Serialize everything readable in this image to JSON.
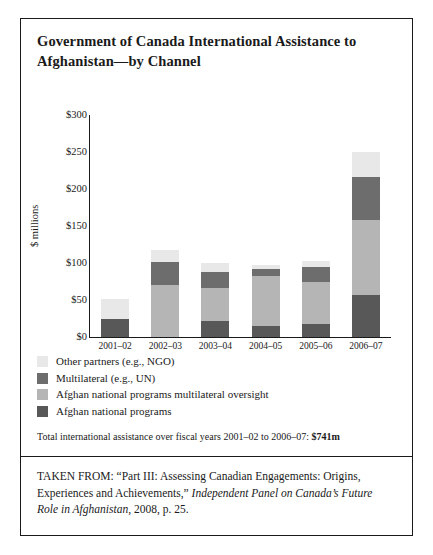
{
  "figure": {
    "title": "Government of Canada International Assistance to Afghanistan—by Channel",
    "total_note_prefix": "Total international assistance over fiscal years 2001–02 to 2006–07: ",
    "total_note_value": "$741m",
    "citation_part1": "TAKEN FROM: “Part III: Assessing Canadian Engagements: Origins, Experiences and Achievements,” ",
    "citation_italic": "Independent Panel on Canada’s Future Role in Afghanistan",
    "citation_part2": ", 2008, p. 25."
  },
  "colors": {
    "other_partners": "#e8e8e8",
    "multilateral": "#6d6d6d",
    "afghan_multilateral_oversight": "#b5b5b5",
    "afghan_national_programs": "#585858",
    "axis": "#1a1a1a",
    "background": "#ffffff"
  },
  "legend": [
    {
      "label": "Other partners (e.g., NGO)",
      "color": "#e8e8e8",
      "key": "other_partners"
    },
    {
      "label": "Multilateral (e.g., UN)",
      "color": "#6d6d6d",
      "key": "multilateral"
    },
    {
      "label": "Afghan national programs multilateral oversight",
      "color": "#b5b5b5",
      "key": "afghan_multilateral_oversight"
    },
    {
      "label": "Afghan national programs",
      "color": "#585858",
      "key": "afghan_national_programs"
    }
  ],
  "chart_data": {
    "type": "bar",
    "subtype": "stacked",
    "title": "Government of Canada International Assistance to Afghanistan—by Channel",
    "xlabel": "",
    "ylabel": "$ millions",
    "ylim": [
      0,
      300
    ],
    "yticks": [
      300,
      250,
      200,
      150,
      100,
      50,
      0
    ],
    "ytick_labels": [
      "$300",
      "$250",
      "$200",
      "$150",
      "$100",
      "$50",
      "$0"
    ],
    "grid": false,
    "legend_position": "below-plot",
    "categories": [
      "2001–02",
      "2002–03",
      "2003–04",
      "2004–05",
      "2005–06",
      "2006–07"
    ],
    "series": [
      {
        "name": "Afghan national programs",
        "color": "#585858",
        "values": [
          25,
          0,
          22,
          15,
          18,
          57
        ]
      },
      {
        "name": "Afghan national programs multilateral oversight",
        "color": "#b5b5b5",
        "values": [
          0,
          70,
          44,
          67,
          56,
          101
        ]
      },
      {
        "name": "Multilateral (e.g., UN)",
        "color": "#6d6d6d",
        "values": [
          0,
          32,
          22,
          10,
          20,
          58
        ]
      },
      {
        "name": "Other partners (e.g., NGO)",
        "color": "#e8e8e8",
        "values": [
          27,
          15,
          12,
          5,
          9,
          34
        ]
      }
    ],
    "totals": [
      52,
      117,
      100,
      97,
      103,
      250
    ],
    "grand_total": 741,
    "units": "millions of Canadian dollars"
  }
}
